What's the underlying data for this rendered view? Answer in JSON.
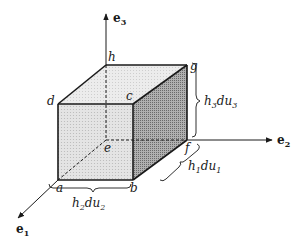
{
  "diagram": {
    "axes": [
      {
        "id": "e1",
        "label": "e",
        "subscript": "1"
      },
      {
        "id": "e2",
        "label": "e",
        "subscript": "2"
      },
      {
        "id": "e3",
        "label": "e",
        "subscript": "3"
      }
    ],
    "vertices": [
      "a",
      "b",
      "c",
      "d",
      "e",
      "f",
      "g",
      "h"
    ],
    "dimensions": [
      {
        "id": "h1du1",
        "parts": [
          "h",
          "1",
          "du",
          "1"
        ]
      },
      {
        "id": "h2du2",
        "parts": [
          "h",
          "2",
          "du",
          "2"
        ]
      },
      {
        "id": "h3du3",
        "parts": [
          "h",
          "3",
          "du",
          "3"
        ]
      }
    ],
    "colors": {
      "line": "#1a1a1a",
      "front_face": "#dcdcdc",
      "top_face": "#e6e6e6",
      "side_face": "#9a9a9a"
    }
  }
}
